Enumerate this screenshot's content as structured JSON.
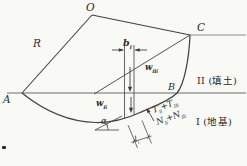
{
  "colors": {
    "background": "#f9f9f6",
    "main_line": "#414141",
    "ground_line": "#6a6a6a",
    "crest_line": "#8f8f8f"
  },
  "labels": {
    "point_o": "O",
    "point_a": "A",
    "point_b": "B",
    "point_c": "C",
    "radius": "R",
    "slice_width": {
      "main": "b",
      "sub": "i"
    },
    "weight_fill": {
      "main": "w",
      "sub": "IIi"
    },
    "weight_foundation": {
      "main": "w",
      "sub": "Ii"
    },
    "region_fill": "II (填土)",
    "region_foundation": "I (地基)",
    "shear_sum": {
      "a": "T",
      "a_sub": "Ii",
      "plus": "+",
      "b": "T",
      "b_sub": "IIi"
    },
    "normal_sum": {
      "a": "N",
      "a_sub": "Ii",
      "plus": "+",
      "b": "N",
      "b_sub": "IIi"
    },
    "base_angle": {
      "main": "α",
      "sub": "i"
    },
    "base_length": {
      "main": "l",
      "sub": "i"
    }
  }
}
